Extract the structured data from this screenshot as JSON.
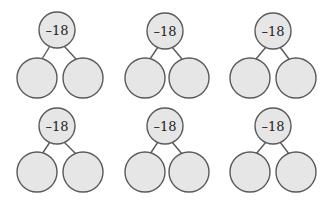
{
  "colors": {
    "circle_fill": "#e6e6e6",
    "circle_stroke": "#5a5a5a",
    "text": "#222222",
    "background": "#ffffff"
  },
  "part_whole_models": [
    {
      "whole": "–18",
      "parts": [
        "",
        ""
      ]
    },
    {
      "whole": "–18",
      "parts": [
        "",
        ""
      ]
    },
    {
      "whole": "–18",
      "parts": [
        "",
        ""
      ]
    },
    {
      "whole": "–18",
      "parts": [
        "",
        ""
      ]
    },
    {
      "whole": "–18",
      "parts": [
        "",
        ""
      ]
    },
    {
      "whole": "–18",
      "parts": [
        "",
        ""
      ]
    }
  ]
}
